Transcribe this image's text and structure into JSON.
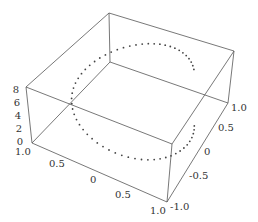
{
  "chart_data": {
    "type": "scatter3d",
    "title": "",
    "xlabel": "",
    "ylabel": "",
    "zlabel": "",
    "x_ticks": [
      "1.0",
      "0.5",
      "0",
      "0.5",
      "1.0"
    ],
    "y_ticks": [
      "1.0",
      "0.5",
      "0",
      "-0.5",
      "-1.0"
    ],
    "z_ticks": [
      "8",
      "6",
      "4",
      "2",
      "0"
    ],
    "xlim": [
      -1.0,
      1.0
    ],
    "ylim": [
      -1.0,
      1.0
    ],
    "zlim": [
      0,
      8
    ],
    "series": [
      {
        "name": "helix points",
        "description": "Points on a circle of radius 1 (x=cos t, y=sin t) with height z increasing from about 0 to about 7.5 as t goes around once",
        "t_range": [
          0,
          6.28
        ],
        "z_range": [
          0,
          7.5
        ],
        "point_count": 60
      }
    ],
    "box": true,
    "grid": false
  },
  "colors": {
    "edge": "#555555",
    "dot": "#444444",
    "text": "#333333"
  }
}
